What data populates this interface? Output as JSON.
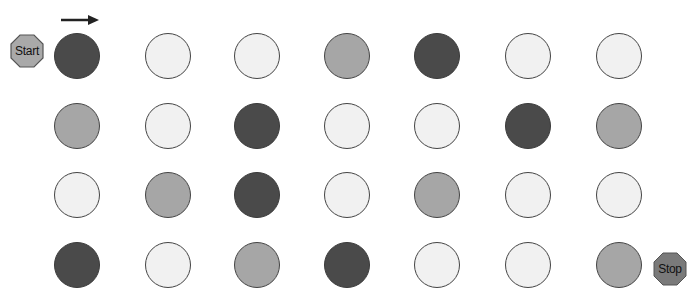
{
  "start_label": "Start",
  "stop_label": "Stop",
  "arrow": "right-arrow",
  "colors": {
    "dark": "#4a4a4a",
    "medium": "#a6a6a6",
    "light": "#f1f1f1",
    "start_fill": "#a9a9a9",
    "stop_fill": "#7a7a7a"
  },
  "grid": {
    "columns": 7,
    "rows": 4,
    "cells": [
      [
        "dark",
        "light",
        "light",
        "medium",
        "dark",
        "light",
        "light"
      ],
      [
        "medium",
        "light",
        "dark",
        "light",
        "light",
        "dark",
        "medium"
      ],
      [
        "light",
        "medium",
        "dark",
        "light",
        "medium",
        "light",
        "light"
      ],
      [
        "dark",
        "light",
        "medium",
        "dark",
        "light",
        "light",
        "medium"
      ]
    ]
  }
}
